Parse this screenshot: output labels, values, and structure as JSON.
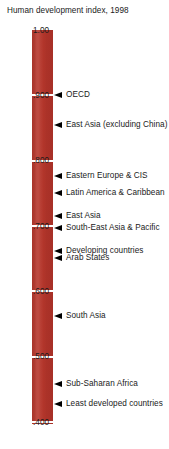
{
  "chart": {
    "title": "Human development index, 1998"
  },
  "axis": {
    "ticks": [
      {
        "label": "1.00",
        "value": 1.0
      },
      {
        "label": ".900",
        "value": 0.9
      },
      {
        "label": ".800",
        "value": 0.8
      },
      {
        "label": ".700",
        "value": 0.7
      },
      {
        "label": ".600",
        "value": 0.6
      },
      {
        "label": ".500",
        "value": 0.5
      },
      {
        "label": ".400",
        "value": 0.4
      }
    ]
  },
  "markers": [
    {
      "label": "OECD",
      "value": 0.9
    },
    {
      "label": "East Asia (excluding China)",
      "value": 0.854
    },
    {
      "label": "Eastern Europe & CIS",
      "value": 0.777
    },
    {
      "label": "Latin America & Caribbean",
      "value": 0.751
    },
    {
      "label": "East Asia",
      "value": 0.716
    },
    {
      "label": "South-East Asia & Pacific",
      "value": 0.697
    },
    {
      "label": "Developing countries",
      "value": 0.661
    },
    {
      "label": "Arab States",
      "value": 0.651
    },
    {
      "label": "South Asia",
      "value": 0.562
    },
    {
      "label": "Sub-Saharan Africa",
      "value": 0.458
    },
    {
      "label": "Least developed countries",
      "value": 0.427
    }
  ],
  "colors": {
    "bar": "#b3372c",
    "gridline": "#ffffff",
    "text": "#1a1a1a",
    "arrow": "#000000",
    "background": "#ffffff"
  },
  "chart_data": {
    "type": "bar",
    "title": "Human development index, 1998",
    "xlabel": "",
    "ylabel": "Human development index",
    "ylim": [
      0.4,
      1.0
    ],
    "grid": true,
    "legend": "none",
    "orientation": "vertical-scale-with-annotations",
    "tick_labels": [
      "1.00",
      ".900",
      ".800",
      ".700",
      ".600",
      ".500",
      ".400"
    ],
    "tick_values": [
      1.0,
      0.9,
      0.8,
      0.7,
      0.6,
      0.5,
      0.4
    ],
    "categories": [
      "OECD",
      "East Asia (excluding China)",
      "Eastern Europe & CIS",
      "Latin America & Caribbean",
      "East Asia",
      "South-East Asia & Pacific",
      "Developing countries",
      "Arab States",
      "South Asia",
      "Sub-Saharan Africa",
      "Least developed countries"
    ],
    "values": [
      0.9,
      0.854,
      0.777,
      0.751,
      0.716,
      0.697,
      0.661,
      0.651,
      0.562,
      0.458,
      0.427
    ]
  }
}
